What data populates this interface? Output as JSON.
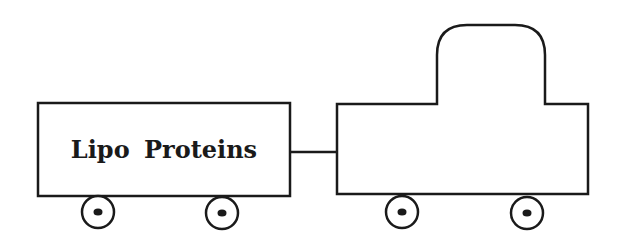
{
  "diagram": {
    "type": "train",
    "wagon": {
      "label": "Lipo Proteins",
      "wheels": 2
    },
    "engine": {
      "label": "",
      "wheels": 2
    },
    "coupler": true,
    "colors": {
      "stroke": "#1a1a1a",
      "fill": "#ffffff",
      "background": "#ffffff"
    }
  }
}
